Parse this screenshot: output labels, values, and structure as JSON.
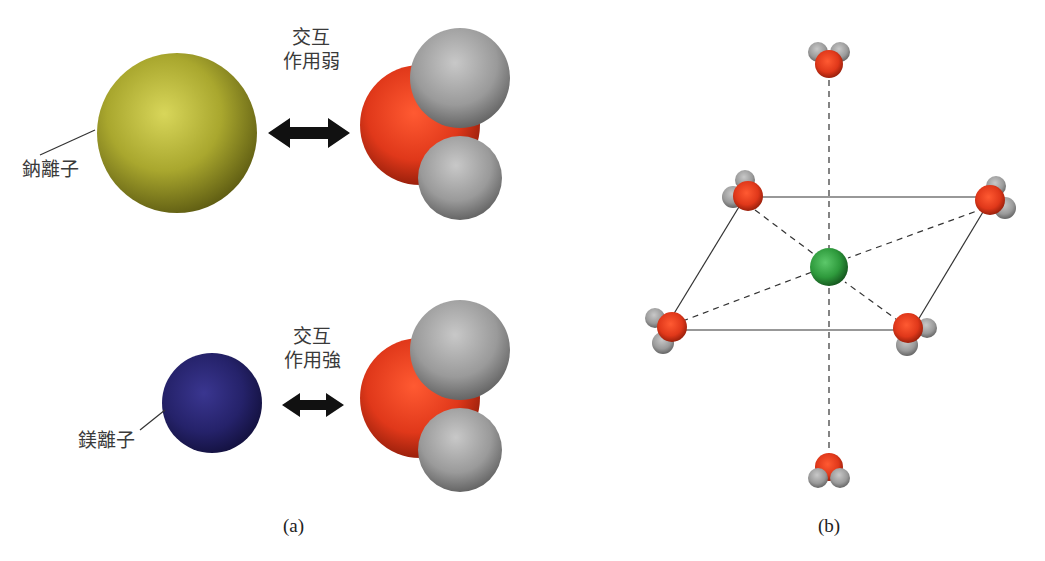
{
  "panel_a": {
    "caption": "(a)",
    "top_row": {
      "ion_label": "鈉離子",
      "interaction_line1": "交互",
      "interaction_line2": "作用弱",
      "ion_color": "#a8a630",
      "arrow": "double-headed-arrow"
    },
    "bottom_row": {
      "ion_label": "鎂離子",
      "interaction_line1": "交互",
      "interaction_line2": "作用強",
      "ion_color": "#25226a",
      "arrow": "double-headed-arrow"
    },
    "water_colors": {
      "oxygen": "#e0381a",
      "hydrogen": "#9a9a9a"
    }
  },
  "panel_b": {
    "caption": "(b)",
    "description": "octahedral coordination: central ion with six water molecules",
    "central_ion_color": "#2e9a3c",
    "water_count": 6
  }
}
